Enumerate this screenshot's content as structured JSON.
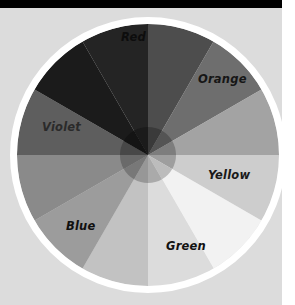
{
  "figure": {
    "background_color": "#dcdcdc",
    "page_white": "#ffffff",
    "top_bar_color": "#000000"
  },
  "wheel": {
    "center_x": 148,
    "center_y": 147,
    "outer_radius": 138,
    "ring_color": "#ffffff",
    "ring_width": 7,
    "hub_radius": 28,
    "segment_count": 12,
    "start_angle_deg": -90
  },
  "chart_data": {
    "type": "pie",
    "xlabel": "",
    "ylabel": "",
    "legend_position": "on-slice",
    "grid": false,
    "categories": [
      "Red",
      "Red-Orange",
      "Orange",
      "Yellow-Orange",
      "Yellow",
      "Yellow-Green",
      "Green",
      "Blue-Green",
      "Blue",
      "Blue-Violet",
      "Violet",
      "Red-Violet"
    ],
    "values": [
      30,
      30,
      30,
      30,
      30,
      30,
      30,
      30,
      30,
      30,
      30,
      30
    ],
    "colors": [
      "#4d4d4d",
      "#6e6e6e",
      "#a3a3a3",
      "#cdcdcd",
      "#f2f2f2",
      "#dcdcdc",
      "#c2c2c2",
      "#9c9c9c",
      "#8a8a8a",
      "#5e5e5e",
      "#1b1b1b",
      "#242424"
    ],
    "hub_colors": [
      "#3a3a3a",
      "#545454",
      "#7d7d7d",
      "#9e9e9e",
      "#bcbcbc",
      "#aaaaaa",
      "#979797",
      "#787878",
      "#6a6a6a",
      "#484848",
      "#141414",
      "#1b1b1b"
    ]
  },
  "labels": [
    {
      "id": "red",
      "text": "Red",
      "x": 121,
      "y": 33,
      "color": "#0d0d0d"
    },
    {
      "id": "orange",
      "text": "Orange",
      "x": 198,
      "y": 75,
      "color": "#161616"
    },
    {
      "id": "yellow",
      "text": "Yellow",
      "x": 208,
      "y": 171,
      "color": "#1a1a1a"
    },
    {
      "id": "green",
      "text": "Green",
      "x": 166,
      "y": 242,
      "color": "#111111"
    },
    {
      "id": "blue",
      "text": "Blue",
      "x": 66,
      "y": 222,
      "color": "#101010"
    },
    {
      "id": "violet",
      "text": "Violet",
      "x": 42,
      "y": 123,
      "color": "#2a2a2a"
    }
  ]
}
